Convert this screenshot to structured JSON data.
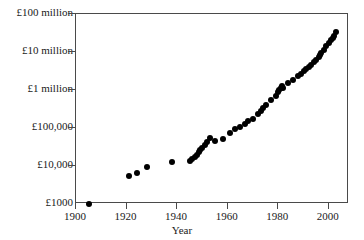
{
  "chart_data": {
    "type": "scatter",
    "title": "",
    "xlabel": "Year",
    "ylabel": "",
    "xlim": [
      1900,
      2008
    ],
    "ylim": [
      1000,
      100000000
    ],
    "yscale": "log",
    "grid": false,
    "legend": null,
    "xticks": [
      1900,
      1920,
      1940,
      1960,
      1980,
      2000
    ],
    "xticklabels": [
      "1900",
      "1920",
      "1940",
      "1960",
      "1980",
      "2000"
    ],
    "yticks": [
      1000,
      10000,
      100000,
      1000000,
      10000000,
      100000000
    ],
    "yticklabels": [
      "£1000",
      "£10,000",
      "£100,000",
      "£1 million",
      "£10 million",
      "£100 million"
    ],
    "marker": "filled-circle",
    "marker_color": "#000000",
    "points": [
      {
        "x": 1905,
        "y": 1000
      },
      {
        "x": 1921,
        "y": 5300
      },
      {
        "x": 1924,
        "y": 6500
      },
      {
        "x": 1928,
        "y": 9500
      },
      {
        "x": 1938,
        "y": 13000
      },
      {
        "x": 1945,
        "y": 13500
      },
      {
        "x": 1946,
        "y": 15000
      },
      {
        "x": 1947,
        "y": 17500
      },
      {
        "x": 1948,
        "y": 20000
      },
      {
        "x": 1948.5,
        "y": 23000
      },
      {
        "x": 1949,
        "y": 26000
      },
      {
        "x": 1950,
        "y": 30000
      },
      {
        "x": 1951,
        "y": 35000
      },
      {
        "x": 1952,
        "y": 42000
      },
      {
        "x": 1953,
        "y": 55000
      },
      {
        "x": 1955,
        "y": 46000
      },
      {
        "x": 1958,
        "y": 52000
      },
      {
        "x": 1961,
        "y": 75000
      },
      {
        "x": 1963,
        "y": 95000
      },
      {
        "x": 1965,
        "y": 105000
      },
      {
        "x": 1967,
        "y": 130000
      },
      {
        "x": 1968,
        "y": 150000
      },
      {
        "x": 1970,
        "y": 175000
      },
      {
        "x": 1972,
        "y": 240000
      },
      {
        "x": 1973,
        "y": 275000
      },
      {
        "x": 1974,
        "y": 330000
      },
      {
        "x": 1975,
        "y": 400000
      },
      {
        "x": 1977,
        "y": 560000
      },
      {
        "x": 1979,
        "y": 700000
      },
      {
        "x": 1980,
        "y": 900000
      },
      {
        "x": 1980.5,
        "y": 1000000
      },
      {
        "x": 1981,
        "y": 1100000
      },
      {
        "x": 1981.5,
        "y": 1250000
      },
      {
        "x": 1982,
        "y": 1150000
      },
      {
        "x": 1984,
        "y": 1500000
      },
      {
        "x": 1986,
        "y": 1800000
      },
      {
        "x": 1988,
        "y": 2300000
      },
      {
        "x": 1989,
        "y": 2700000
      },
      {
        "x": 1990,
        "y": 3100000
      },
      {
        "x": 1991,
        "y": 3500000
      },
      {
        "x": 1992,
        "y": 4000000
      },
      {
        "x": 1993,
        "y": 4600000
      },
      {
        "x": 1994,
        "y": 5500000
      },
      {
        "x": 1995,
        "y": 6200000
      },
      {
        "x": 1996,
        "y": 7500000
      },
      {
        "x": 1996.5,
        "y": 8500000
      },
      {
        "x": 1997,
        "y": 9500000
      },
      {
        "x": 1998,
        "y": 11000000
      },
      {
        "x": 1999,
        "y": 14000000
      },
      {
        "x": 2000,
        "y": 17000000
      },
      {
        "x": 2001,
        "y": 21000000
      },
      {
        "x": 2001.5,
        "y": 24000000
      },
      {
        "x": 2002,
        "y": 27000000
      },
      {
        "x": 2003,
        "y": 33000000
      }
    ]
  }
}
